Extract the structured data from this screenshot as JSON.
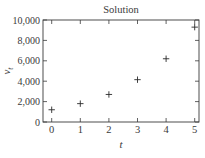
{
  "chart_data": {
    "type": "scatter",
    "title": "Solution",
    "xlabel": "t",
    "ylabel": "v",
    "ylabel_subscript": "t",
    "x": [
      0,
      1,
      2,
      3,
      4,
      5
    ],
    "series": [
      {
        "name": "v_t",
        "marker": "plus",
        "values": [
          1200,
          1800,
          2700,
          4150,
          6200,
          9300
        ]
      }
    ],
    "xlim": [
      -0.3,
      5.15
    ],
    "ylim": [
      0,
      10000
    ],
    "xticks": [
      0,
      1,
      2,
      3,
      4,
      5
    ],
    "xtick_labels": [
      "0",
      "1",
      "2",
      "3",
      "4",
      "5"
    ],
    "yticks": [
      0,
      2000,
      4000,
      6000,
      8000,
      10000
    ],
    "ytick_labels": [
      "0",
      "2,000",
      "4,000",
      "6,000",
      "8,000",
      "10,000"
    ],
    "grid": false,
    "legend": null,
    "colors": {
      "axis": "#3a3a3a",
      "marker": "#2a2a2a",
      "background": "#ffffff"
    }
  }
}
